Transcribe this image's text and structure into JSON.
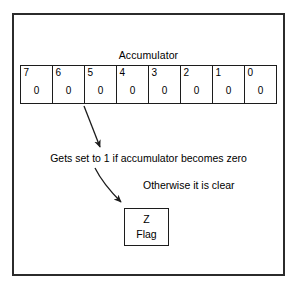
{
  "figure": {
    "title_label": "Accumulator",
    "frame": {
      "border_color": "#2b2b2b"
    }
  },
  "accumulator": {
    "label": "Accumulator",
    "bits": [
      {
        "index": "7",
        "value": "0"
      },
      {
        "index": "6",
        "value": "0"
      },
      {
        "index": "5",
        "value": "0"
      },
      {
        "index": "4",
        "value": "0"
      },
      {
        "index": "3",
        "value": "0"
      },
      {
        "index": "2",
        "value": "0"
      },
      {
        "index": "1",
        "value": "0"
      },
      {
        "index": "0",
        "value": "0"
      }
    ]
  },
  "annotations": {
    "set_condition": "Gets set to 1 if accumulator becomes zero",
    "clear_condition": "Otherwise it is clear"
  },
  "zero_flag": {
    "symbol": "Z",
    "label": "Flag"
  },
  "arrows": [
    {
      "name": "arrow-accumulator-to-note",
      "from_x": 84,
      "from_y": 106,
      "to_x": 100,
      "to_y": 148
    },
    {
      "name": "arrow-note-to-zflag",
      "from_x": 95,
      "from_y": 168,
      "to_x": 122,
      "to_y": 204
    }
  ],
  "colors": {
    "ink": "#1c1c1c",
    "frame": "#2b2b2b",
    "paper": "#ffffff"
  }
}
